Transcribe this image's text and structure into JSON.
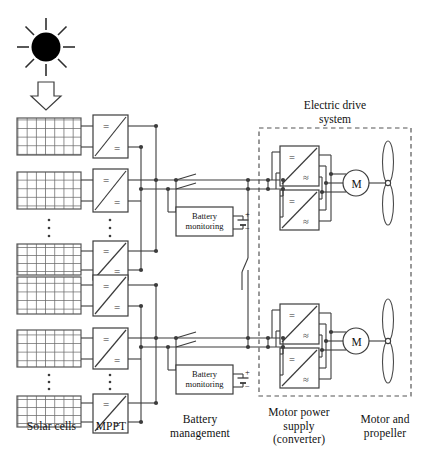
{
  "figure": {
    "title_inside": "Electric drive\nsystem",
    "legend_captions": [
      {
        "id": "solar-cells",
        "text": "Solar cells",
        "x": 14,
        "y": 420
      },
      {
        "id": "mppt",
        "text": "MPPT",
        "x": 94,
        "y": 420
      },
      {
        "id": "battery-management",
        "text": "Battery\nmanagement",
        "x": 161,
        "y": 414
      },
      {
        "id": "motor-power-supply",
        "text": "Motor power\nsupply\n(converter)",
        "x": 261,
        "y": 407
      },
      {
        "id": "motor-and-propeller",
        "text": "Motor and\npropeller",
        "x": 343,
        "y": 414
      }
    ]
  },
  "blocks": {
    "mppt_converter": {
      "input_symbol": "=",
      "output_symbol": "=",
      "count_visible": 6
    },
    "drive_inverter": {
      "input_symbol": "=",
      "output_symbol": "≈",
      "count_visible": 4
    },
    "battery_monitoring": {
      "label": "Battery\nmonitoring",
      "count": 2
    },
    "battery_terminals": {
      "positive": "+",
      "negative": "−"
    },
    "motor": {
      "label": "M",
      "count": 2
    },
    "propeller": {
      "blades": 2,
      "count": 2
    },
    "sun": {
      "rays": 8
    },
    "ellipsis": {
      "dots": 3,
      "groups": 4
    }
  },
  "colors": {
    "line": "#3c3c3c",
    "text": "#111111",
    "sun": "#000000",
    "background": "#ffffff",
    "dashed_border": "#555555",
    "panel_grid": "#6a6a6a"
  },
  "counts": {
    "solar_panel_strings": 6,
    "switches": 5,
    "drive_systems": 2
  }
}
